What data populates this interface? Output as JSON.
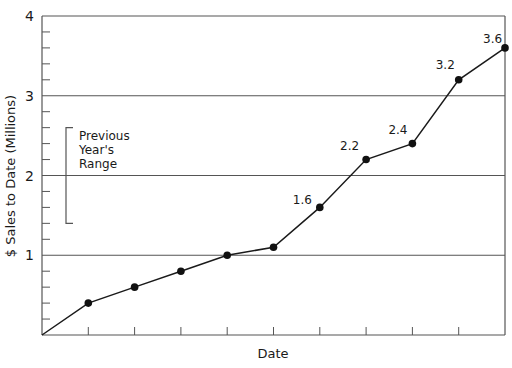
{
  "chart_data": {
    "type": "line",
    "title": "",
    "xlabel": "Date",
    "ylabel": "$ Sales to Date (Millions)",
    "ylim": [
      0,
      4
    ],
    "yticks": [
      "1",
      "2",
      "3",
      "4"
    ],
    "y_minor_step": 0.2,
    "grid": true,
    "x": [
      0,
      1,
      2,
      3,
      4,
      5,
      6,
      7,
      8,
      9,
      10
    ],
    "series": [
      {
        "name": "Sales to Date",
        "values": [
          0,
          0.4,
          0.6,
          0.8,
          1.0,
          1.1,
          1.6,
          2.2,
          2.4,
          3.2,
          3.6
        ]
      }
    ],
    "data_labels": [
      {
        "index": 6,
        "text": "1.6"
      },
      {
        "index": 7,
        "text": "2.2"
      },
      {
        "index": 8,
        "text": "2.4"
      },
      {
        "index": 9,
        "text": "3.2"
      },
      {
        "index": 10,
        "text": "3.6"
      }
    ],
    "annotations": [
      {
        "type": "bracket",
        "label_lines": [
          "Previous",
          "Year's",
          "Range"
        ],
        "y_low": 1.4,
        "y_high": 2.6
      }
    ],
    "legend": null
  }
}
